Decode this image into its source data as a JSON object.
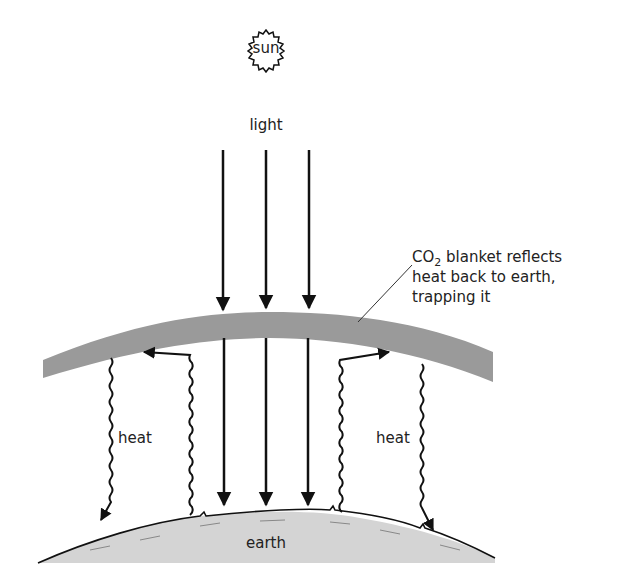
{
  "diagram": {
    "colors": {
      "background": "#ffffff",
      "ink": "#111111",
      "blanket": "#9a9a9a",
      "earth_fill": "#d4d4d4"
    },
    "sun": {
      "label": "sun"
    },
    "light": {
      "label": "light",
      "arrow_count": 3
    },
    "blanket": {
      "caption_line1_prefix": "CO",
      "caption_line1_sub": "2",
      "caption_line1_suffix": " blanket reflects",
      "caption_line2": "heat back to earth,",
      "caption_line3": "trapping it"
    },
    "heat_left": {
      "label": "heat"
    },
    "heat_right": {
      "label": "heat"
    },
    "earth": {
      "label": "earth"
    }
  }
}
